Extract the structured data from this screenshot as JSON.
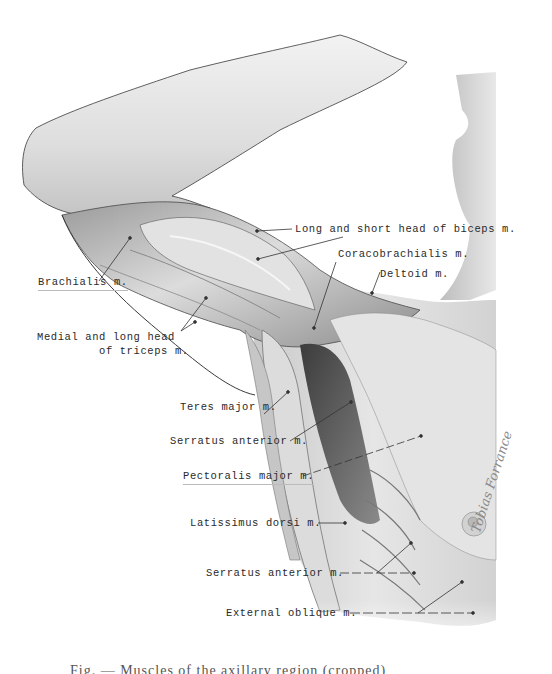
{
  "figure": {
    "type": "anatomical illustration",
    "labels": [
      {
        "id": "biceps",
        "text": "Long and short head of biceps m."
      },
      {
        "id": "coracobrachialis",
        "text": "Coracobrachialis m."
      },
      {
        "id": "deltoid",
        "text": "Deltoid m."
      },
      {
        "id": "brachialis",
        "text": "Brachialis m."
      },
      {
        "id": "triceps_line1",
        "text": "Medial and long head"
      },
      {
        "id": "triceps_line2",
        "text": "of triceps m."
      },
      {
        "id": "teres_major",
        "text": "Teres major m."
      },
      {
        "id": "serratus_upper",
        "text": "Serratus anterior m."
      },
      {
        "id": "pectoralis_major",
        "text": "Pectoralis major m."
      },
      {
        "id": "latissimus_dorsi",
        "text": "Latissimus dorsi m."
      },
      {
        "id": "serratus_lower",
        "text": "Serratus anterior m."
      },
      {
        "id": "external_oblique",
        "text": "External oblique m."
      }
    ],
    "signature": "Tobias Forrance",
    "caption": "Fig. — Muscles of the axillary region (cropped)"
  },
  "colors": {
    "skin_light": "#ececec",
    "skin_mid": "#cfcfcf",
    "shadow": "#7a7a7a",
    "outline": "#3a3a3a",
    "leader": "#333333",
    "text": "#2a2a2a"
  }
}
